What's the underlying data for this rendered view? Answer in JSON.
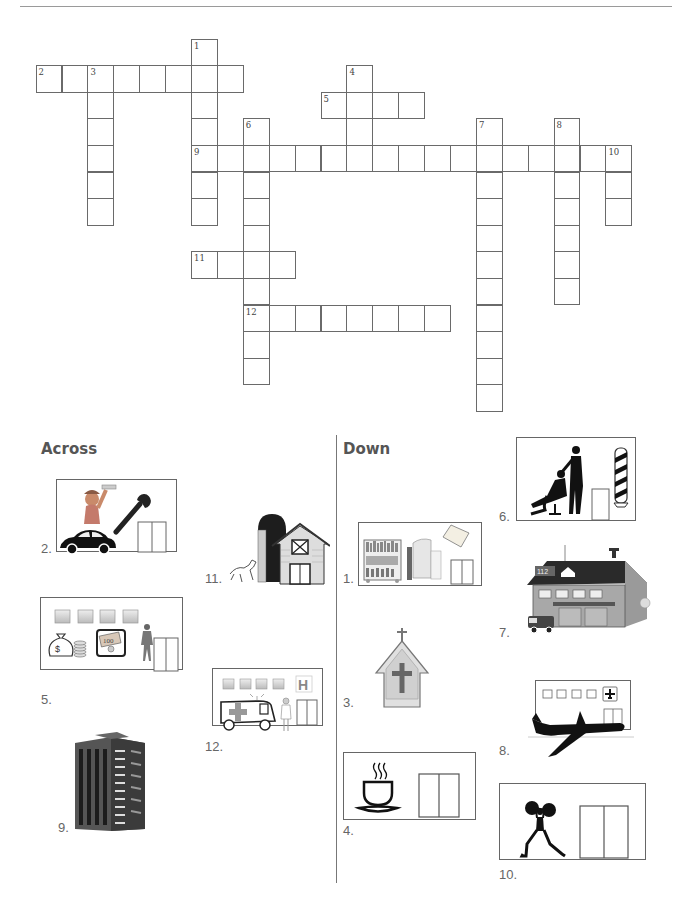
{
  "worksheet": {
    "grid": {
      "origin_x": 35.6,
      "origin_y": 38.5,
      "cell_w": 25.9,
      "cell_h": 26.6,
      "entries": [
        {
          "number": "1",
          "direction": "down",
          "row": 0,
          "col": 6,
          "length": 7
        },
        {
          "number": "2",
          "direction": "across",
          "row": 1,
          "col": 0,
          "length": 8
        },
        {
          "number": "3",
          "direction": "down",
          "row": 1,
          "col": 2,
          "length": 6
        },
        {
          "number": "4",
          "direction": "down",
          "row": 1,
          "col": 12,
          "length": 4
        },
        {
          "number": "5",
          "direction": "across",
          "row": 2,
          "col": 11,
          "length": 4
        },
        {
          "number": "6",
          "direction": "down",
          "row": 3,
          "col": 8,
          "length": 10
        },
        {
          "number": "7",
          "direction": "down",
          "row": 3,
          "col": 17,
          "length": 11
        },
        {
          "number": "8",
          "direction": "down",
          "row": 3,
          "col": 20,
          "length": 7
        },
        {
          "number": "9",
          "direction": "across",
          "row": 4,
          "col": 6,
          "length": 17
        },
        {
          "number": "10",
          "direction": "down",
          "row": 4,
          "col": 22,
          "length": 3
        },
        {
          "number": "11",
          "direction": "across",
          "row": 8,
          "col": 6,
          "length": 4
        },
        {
          "number": "12",
          "direction": "across",
          "row": 10,
          "col": 8,
          "length": 8
        }
      ]
    },
    "across": {
      "heading": "Across",
      "clues": [
        {
          "number": "2.",
          "picture": "car-mechanic-garage"
        },
        {
          "number": "5.",
          "picture": "bank"
        },
        {
          "number": "9.",
          "picture": "apartment-building"
        },
        {
          "number": "11.",
          "picture": "farm-barn"
        },
        {
          "number": "12.",
          "picture": "hospital"
        }
      ]
    },
    "down": {
      "heading": "Down",
      "clues": [
        {
          "number": "1.",
          "picture": "library"
        },
        {
          "number": "3.",
          "picture": "church"
        },
        {
          "number": "4.",
          "picture": "cafe"
        },
        {
          "number": "6.",
          "picture": "barber-shop"
        },
        {
          "number": "7.",
          "picture": "fire-station"
        },
        {
          "number": "8.",
          "picture": "airport"
        },
        {
          "number": "10.",
          "picture": "gym"
        }
      ]
    },
    "fire_station_sign": "112",
    "hospital_sign": "H",
    "bank_note": "100"
  }
}
